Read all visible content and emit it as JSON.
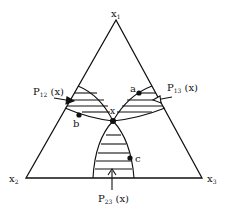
{
  "diagram": {
    "vertices": {
      "x1": {
        "label": "x",
        "sub": "1"
      },
      "x2": {
        "label": "x",
        "sub": "2"
      },
      "x3": {
        "label": "x",
        "sub": "3"
      }
    },
    "regions": {
      "p12": {
        "label": "P",
        "sub": "12",
        "arg": " (x)"
      },
      "p13": {
        "label": "P",
        "sub": "13",
        "arg": " (x)"
      },
      "p23": {
        "label": "P",
        "sub": "23",
        "arg": " (x)"
      }
    },
    "points": {
      "x": {
        "label": "x"
      },
      "a": {
        "label": "a"
      },
      "b": {
        "label": "b"
      },
      "c": {
        "label": "c"
      }
    },
    "colors": {
      "ink": "#111111",
      "background": "#ffffff"
    }
  }
}
